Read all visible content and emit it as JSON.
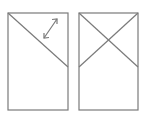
{
  "diagram": {
    "stroke_color": "#7a7a7a",
    "stroke_width": 1.2,
    "panels": [
      {
        "name": "left-panel",
        "rect": {
          "x": 8,
          "y": 13,
          "w": 60,
          "h": 97
        },
        "lines": [
          {
            "x1": 8,
            "y1": 13,
            "x2": 68,
            "y2": 67
          }
        ],
        "arrow": {
          "x1": 44,
          "y1": 38,
          "x2": 57,
          "y2": 19,
          "type": "double-headed"
        }
      },
      {
        "name": "right-panel",
        "rect": {
          "x": 79,
          "y": 13,
          "w": 59,
          "h": 97
        },
        "lines": [
          {
            "x1": 79,
            "y1": 13,
            "x2": 138,
            "y2": 67
          },
          {
            "x1": 138,
            "y1": 13,
            "x2": 79,
            "y2": 67
          }
        ]
      }
    ]
  }
}
